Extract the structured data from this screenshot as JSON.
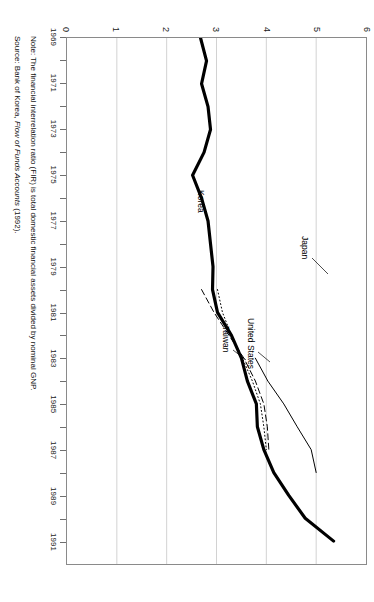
{
  "chart_data": {
    "type": "line",
    "title": "",
    "xlabel": "",
    "ylabel": "",
    "xlim": [
      1969,
      1992
    ],
    "ylim": [
      0,
      6
    ],
    "grid": true,
    "orientation": "rotated-90",
    "legend_position": "inline-labels",
    "x_tick_labels": [
      "1969",
      "1971",
      "1973",
      "1975",
      "1977",
      "1979",
      "1981",
      "1983",
      "1985",
      "1987",
      "1989",
      "1991"
    ],
    "y_tick_labels": [
      "0",
      "1",
      "2",
      "3",
      "4",
      "5",
      "6"
    ],
    "x": [
      1969,
      1970,
      1971,
      1972,
      1973,
      1974,
      1975,
      1976,
      1977,
      1978,
      1979,
      1980,
      1981,
      1982,
      1983,
      1984,
      1985,
      1986,
      1987,
      1988,
      1989,
      1990,
      1991
    ],
    "series": [
      {
        "name": "Korea",
        "style": "solid-thick",
        "color": "#000000",
        "values": [
          2.68,
          2.8,
          2.7,
          2.83,
          2.88,
          2.75,
          2.52,
          2.7,
          2.83,
          2.88,
          2.93,
          2.92,
          3.02,
          3.3,
          3.5,
          3.62,
          3.8,
          3.82,
          3.95,
          4.15,
          4.45,
          4.78,
          5.35
        ]
      },
      {
        "name": "Japan",
        "style": "solid-thin",
        "color": "#000000",
        "values": [
          null,
          null,
          null,
          null,
          null,
          null,
          null,
          null,
          null,
          null,
          null,
          null,
          null,
          null,
          3.78,
          4.03,
          4.35,
          4.62,
          4.9,
          5.0,
          null,
          null,
          null
        ]
      },
      {
        "name": "United States",
        "style": "dotted",
        "color": "#000000",
        "values": [
          null,
          null,
          null,
          null,
          null,
          null,
          null,
          null,
          null,
          null,
          null,
          3.02,
          3.12,
          3.3,
          3.52,
          3.72,
          3.88,
          3.95,
          4.0,
          null,
          null,
          null,
          null
        ]
      },
      {
        "name": "Taiwan",
        "style": "dashed",
        "color": "#000000",
        "values": [
          null,
          null,
          null,
          null,
          null,
          null,
          null,
          null,
          null,
          null,
          null,
          2.7,
          2.95,
          3.25,
          3.55,
          3.78,
          3.95,
          4.02,
          4.05,
          null,
          null,
          null,
          null
        ]
      }
    ]
  },
  "series_labels": [
    {
      "text": "Japan"
    },
    {
      "text": "United States"
    },
    {
      "text": "Taiwan"
    },
    {
      "text": "Korea"
    }
  ],
  "notes": {
    "note_prefix": "Note:",
    "note_text": "The financial interrelation ratio (FIR) is total domestic financial assets divided by nominal GNP.",
    "note_full": "Note: The financial interrelation ratio (FIR) is total domestic financial assets divided by nominal GNP.",
    "source_prefix": "Source:",
    "source_org": "Bank of Korea,",
    "source_pub": "Flow of Funds Accounts",
    "source_year": "(1992).",
    "source_full": "Source: Bank of Korea, Flow of Funds Accounts (1992)."
  },
  "colors": {
    "axis": "#8a8a8a",
    "grid": "#d2d2d2",
    "line": "#000000",
    "text": "#111111",
    "background": "#ffffff"
  }
}
